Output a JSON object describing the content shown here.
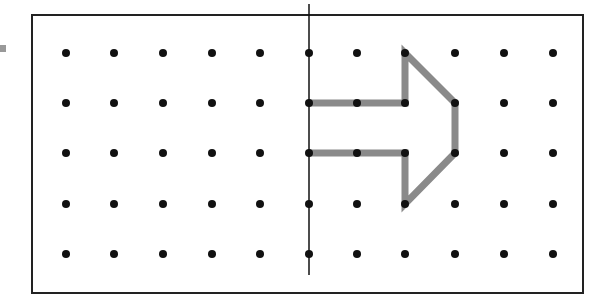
{
  "diagram": {
    "type": "dot-grid reflection",
    "frame": {
      "x": 32,
      "y": 15,
      "width": 551,
      "height": 278,
      "stroke": "#222222"
    },
    "grid": {
      "columns": [
        66,
        114,
        163,
        212,
        260,
        309,
        357,
        405,
        455,
        504,
        553
      ],
      "rows": [
        53,
        103,
        153,
        204,
        254
      ],
      "dot_radius": 4,
      "dot_color": "#111111"
    },
    "mirror_line": {
      "x": 309,
      "y1": 4,
      "y2": 275,
      "color": "#111111"
    },
    "shape": {
      "name": "arrow",
      "stroke": "#8a8a8a",
      "stroke_width": 7,
      "points": [
        [
          309,
          103
        ],
        [
          405,
          103
        ],
        [
          405,
          53
        ],
        [
          455,
          103
        ],
        [
          455,
          153
        ],
        [
          405,
          204
        ],
        [
          405,
          153
        ],
        [
          309,
          153
        ]
      ],
      "closed_at_mirror": true
    },
    "marker_color": "#999999"
  }
}
